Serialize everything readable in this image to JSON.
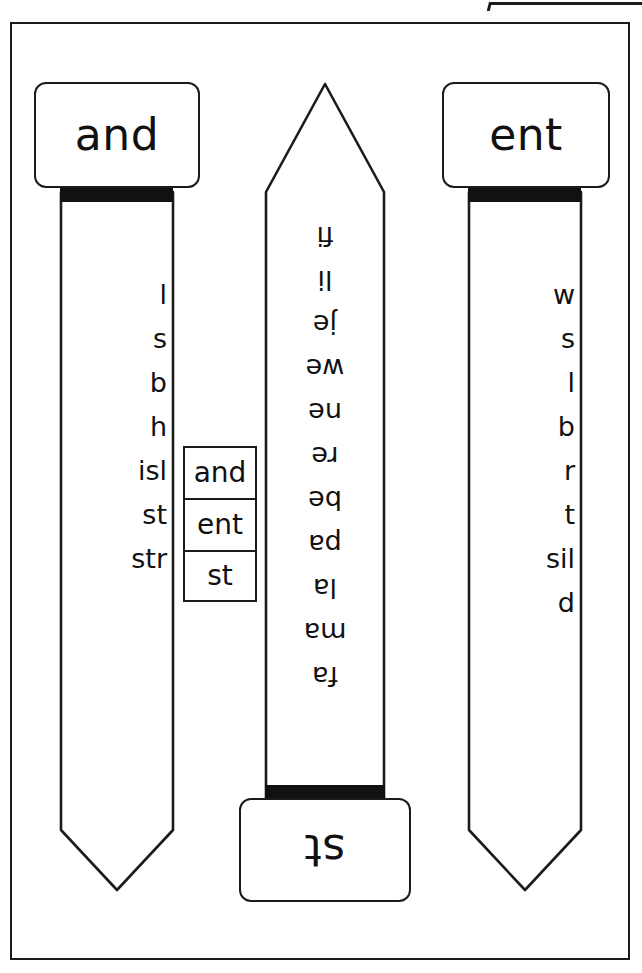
{
  "worksheet": {
    "title": "Phonics word slider worksheet",
    "sliders": [
      {
        "id": "left",
        "label": "and",
        "label_position": "top",
        "orientation": "upright",
        "onsets": [
          "l",
          "s",
          "b",
          "h",
          "isl",
          "st",
          "str"
        ]
      },
      {
        "id": "middle",
        "label": "st",
        "label_position": "bottom",
        "orientation": "rotated-180",
        "onsets": [
          "fi",
          "li",
          "je",
          "we",
          "ne",
          "re",
          "be",
          "pa",
          "la",
          "ma",
          "fa"
        ]
      },
      {
        "id": "right",
        "label": "ent",
        "label_position": "top",
        "orientation": "upright",
        "onsets": [
          "w",
          "s",
          "l",
          "b",
          "r",
          "t",
          "sil",
          "d"
        ]
      }
    ],
    "key_boxes": [
      "and",
      "ent",
      "st"
    ],
    "colors": {
      "ink": "#1b1b1b",
      "slot": "#111111",
      "paper": "#ffffff"
    }
  }
}
